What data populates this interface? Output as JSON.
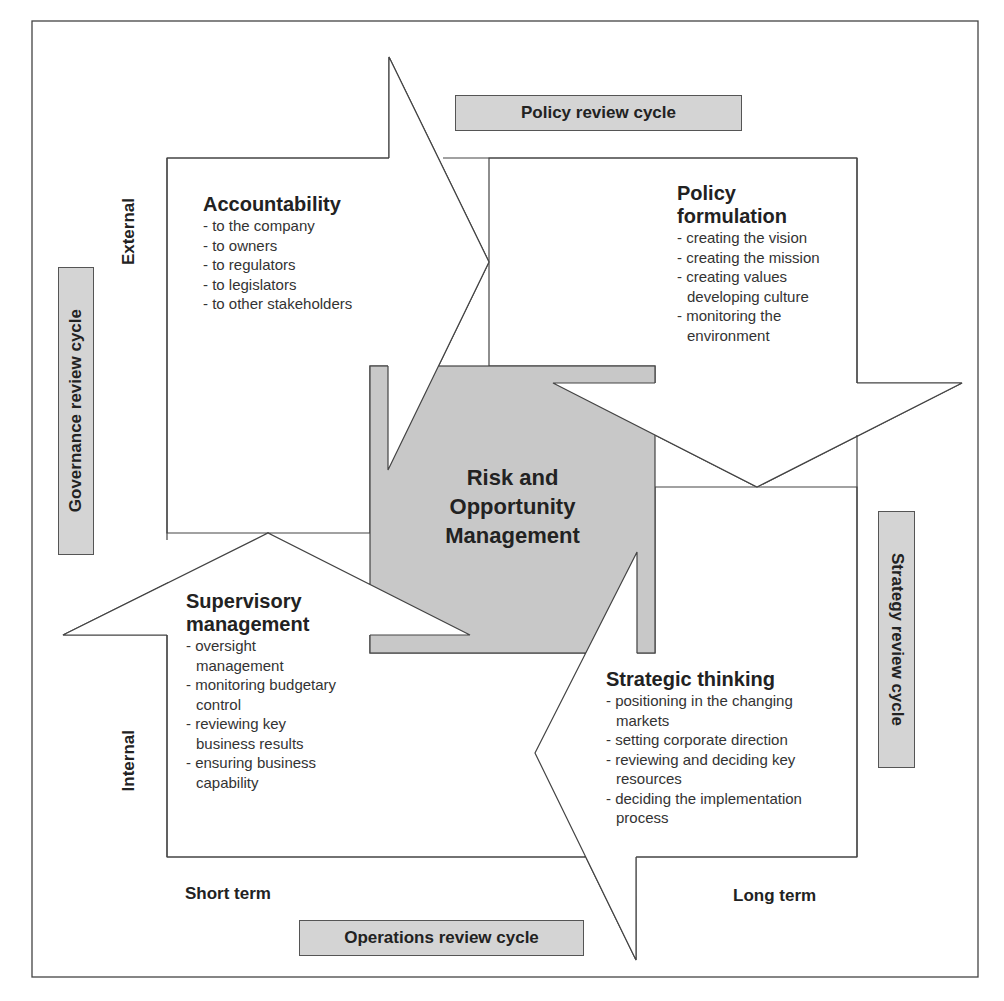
{
  "diagram": {
    "center": {
      "lines": [
        "Risk and",
        "Opportunity",
        "Management"
      ]
    },
    "quadrants": {
      "accountability": {
        "title": "Accountability",
        "items": [
          "to the company",
          "to owners",
          "to regulators",
          "to legislators",
          "to other stakeholders"
        ]
      },
      "policy_formulation": {
        "title_lines": [
          "Policy",
          "formulation"
        ],
        "items": [
          "creating the vision",
          "creating the mission",
          "creating values developing culture",
          "monitoring the environment"
        ]
      },
      "supervisory_management": {
        "title_lines": [
          "Supervisory",
          "management"
        ],
        "items": [
          "oversight management",
          "monitoring budgetary control",
          "reviewing key business results",
          "ensuring business capability"
        ]
      },
      "strategic_thinking": {
        "title": "Strategic thinking",
        "items": [
          "positioning in the changing markets",
          "setting corporate direction",
          "reviewing and deciding key resources",
          "deciding the implementation process"
        ]
      }
    },
    "cycles": {
      "policy": "Policy review cycle",
      "governance": "Governance review cycle",
      "strategy": "Strategy review cycle",
      "operations": "Operations review cycle"
    },
    "axes": {
      "external": "External",
      "internal": "Internal",
      "short_term": "Short term",
      "long_term": "Long term"
    },
    "colors": {
      "box_fill": "#d4d4d4",
      "center_fill": "#c8c8c8",
      "stroke": "#444444",
      "background": "#ffffff"
    }
  }
}
